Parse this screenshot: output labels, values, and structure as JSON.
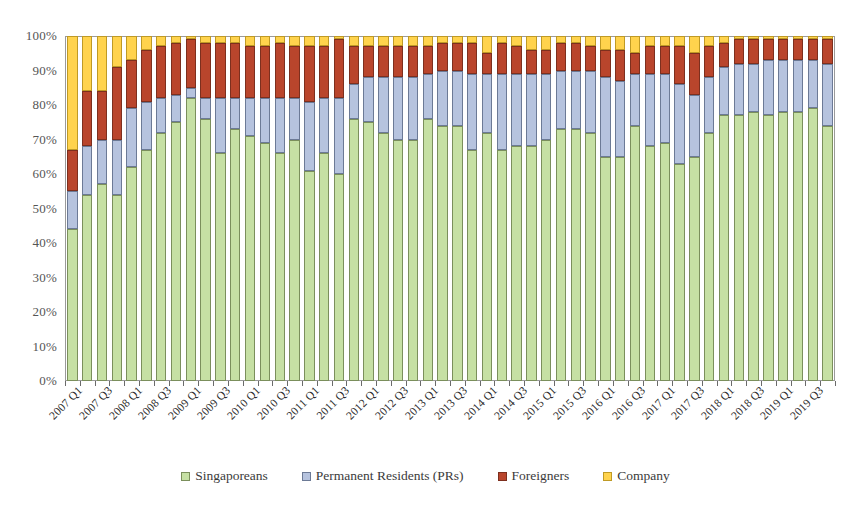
{
  "chart_data": {
    "type": "bar",
    "subtype": "stacked-percent",
    "title": "",
    "xlabel": "",
    "ylabel": "",
    "ylim": [
      0,
      100
    ],
    "ytick_labels": [
      "100%",
      "90%",
      "80%",
      "70%",
      "60%",
      "50%",
      "40%",
      "30%",
      "20%",
      "10%",
      "0%"
    ],
    "ytick_values": [
      100,
      90,
      80,
      70,
      60,
      50,
      40,
      30,
      20,
      10,
      0
    ],
    "grid": false,
    "legend_position": "bottom",
    "categories": [
      "2007 Q1",
      "2007 Q2",
      "2007 Q3",
      "2007 Q4",
      "2008 Q1",
      "2008 Q2",
      "2008 Q3",
      "2008 Q4",
      "2009 Q1",
      "2009 Q2",
      "2009 Q3",
      "2009 Q4",
      "2010 Q1",
      "2010 Q2",
      "2010 Q3",
      "2010 Q4",
      "2011 Q1",
      "2011 Q2",
      "2011 Q3",
      "2011 Q4",
      "2012 Q1",
      "2012 Q2",
      "2012 Q3",
      "2012 Q4",
      "2013 Q1",
      "2013 Q2",
      "2013 Q3",
      "2013 Q4",
      "2014 Q1",
      "2014 Q2",
      "2014 Q3",
      "2014 Q4",
      "2015 Q1",
      "2015 Q2",
      "2015 Q3",
      "2015 Q4",
      "2016 Q1",
      "2016 Q2",
      "2016 Q3",
      "2016 Q4",
      "2017 Q1",
      "2017 Q2",
      "2017 Q3",
      "2017 Q4",
      "2018 Q1",
      "2018 Q2",
      "2018 Q3",
      "2018 Q4",
      "2019 Q1",
      "2019 Q2",
      "2019 Q3",
      "2019 Q4"
    ],
    "tick_label_interval": 2,
    "series": [
      {
        "name": "Singaporeans",
        "color": "#c6e0a4",
        "values": [
          44,
          54,
          57,
          54,
          62,
          67,
          72,
          75,
          82,
          76,
          66,
          73,
          71,
          69,
          66,
          70,
          61,
          66,
          60,
          76,
          75,
          72,
          70,
          70,
          76,
          74,
          74,
          67,
          72,
          67,
          68,
          68,
          70,
          73,
          73,
          72,
          65,
          65,
          74,
          68,
          69,
          63,
          65,
          72,
          77,
          77,
          78,
          77,
          78,
          78,
          79,
          74
        ]
      },
      {
        "name": "Permanent Residents (PRs)",
        "color": "#b6c3de",
        "values": [
          11,
          14,
          13,
          16,
          17,
          14,
          10,
          8,
          3,
          6,
          16,
          9,
          11,
          13,
          16,
          12,
          20,
          16,
          22,
          10,
          13,
          16,
          18,
          18,
          13,
          16,
          16,
          22,
          17,
          22,
          21,
          21,
          19,
          17,
          17,
          18,
          23,
          22,
          15,
          21,
          20,
          23,
          18,
          16,
          14,
          15,
          14,
          16,
          15,
          15,
          14,
          18
        ]
      },
      {
        "name": "Foreigners",
        "color": "#b9452c",
        "values": [
          12,
          16,
          14,
          21,
          14,
          15,
          15,
          15,
          14,
          16,
          16,
          16,
          15,
          15,
          16,
          15,
          16,
          15,
          17,
          11,
          9,
          9,
          9,
          9,
          8,
          8,
          8,
          9,
          6,
          9,
          8,
          7,
          7,
          8,
          8,
          7,
          8,
          9,
          6,
          8,
          8,
          11,
          12,
          9,
          7,
          7,
          7,
          6,
          6,
          6,
          6,
          7
        ]
      },
      {
        "name": "Company",
        "color": "#ffd34d",
        "values": [
          33,
          16,
          16,
          9,
          7,
          4,
          3,
          2,
          1,
          2,
          2,
          2,
          3,
          3,
          2,
          3,
          3,
          3,
          1,
          3,
          3,
          3,
          3,
          3,
          3,
          2,
          2,
          2,
          5,
          2,
          3,
          4,
          4,
          2,
          2,
          3,
          4,
          4,
          5,
          3,
          3,
          3,
          5,
          3,
          2,
          1,
          1,
          1,
          1,
          1,
          1,
          1
        ]
      }
    ],
    "legend": [
      {
        "label": "Singaporeans",
        "color": "#c6e0a4",
        "key": "sg"
      },
      {
        "label": "Permanent Residents (PRs)",
        "color": "#b6c3de",
        "key": "pr"
      },
      {
        "label": "Foreigners",
        "color": "#b9452c",
        "key": "fg"
      },
      {
        "label": "Company",
        "color": "#ffd34d",
        "key": "co"
      }
    ]
  }
}
